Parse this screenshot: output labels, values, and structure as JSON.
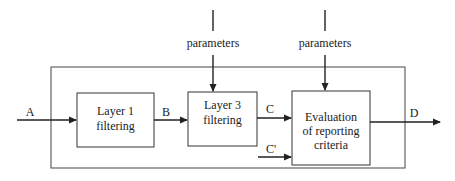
{
  "diagram": {
    "inputs": {
      "A": "A",
      "C_prime": "C'"
    },
    "params": [
      {
        "label": "parameters"
      },
      {
        "label": "parameters"
      }
    ],
    "boxes": {
      "layer1": {
        "line1": "Layer 1",
        "line2": "filtering"
      },
      "layer3": {
        "line1": "Layer 3",
        "line2": "filtering"
      },
      "eval": {
        "line1": "Evaluation",
        "line2": "of reporting",
        "line3": "criteria"
      }
    },
    "edges": {
      "A": "A",
      "B": "B",
      "C": "C",
      "C_prime": "C'",
      "D": "D"
    },
    "output": "D",
    "colors": {
      "stroke": "#222222",
      "background": "#ffffff"
    }
  }
}
